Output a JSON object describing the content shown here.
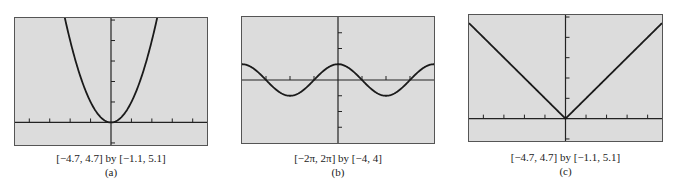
{
  "figure": {
    "panels": [
      {
        "id": "a",
        "range_label": "[−4.7, 4.7] by [−1.1, 5.1]",
        "sub_label": "(a)"
      },
      {
        "id": "b",
        "range_label": "[−2π, 2π] by [−4, 4]",
        "sub_label": "(b)"
      },
      {
        "id": "c",
        "range_label": "[−4.7, 4.7] by [−1.1, 5.1]",
        "sub_label": "(c)"
      }
    ]
  },
  "colors": {
    "plot_background": "#dcdcdc",
    "frame": "#555555",
    "axis": "#222222",
    "curve": "#1a1a1a"
  },
  "chart_data": [
    {
      "type": "line",
      "title": "(a)",
      "function": "y = x^2",
      "xlim": [
        -4.7,
        4.7
      ],
      "ylim": [
        -1.1,
        5.1
      ],
      "xticks": [
        -4,
        -3,
        -2,
        -1,
        1,
        2,
        3,
        4
      ],
      "yticks": [
        -1,
        1,
        2,
        3,
        4,
        5
      ],
      "grid": false,
      "x": [
        -2.26,
        -2,
        -1.5,
        -1,
        -0.5,
        0,
        0.5,
        1,
        1.5,
        2,
        2.26
      ],
      "y": [
        5.1,
        4,
        2.25,
        1,
        0.25,
        0,
        0.25,
        1,
        2.25,
        4,
        5.1
      ],
      "caption": "[−4.7, 4.7] by [−1.1, 5.1]"
    },
    {
      "type": "line",
      "title": "(b)",
      "function": "y = cos x",
      "xlim": [
        -6.2832,
        6.2832
      ],
      "ylim": [
        -4,
        4
      ],
      "xticks": [
        -4.712,
        -3.1416,
        -1.5708,
        1.5708,
        3.1416,
        4.712
      ],
      "yticks": [
        -3,
        -2,
        -1,
        1,
        2,
        3
      ],
      "grid": false,
      "x": [
        -6.2832,
        -4.712,
        -3.1416,
        -1.5708,
        0,
        1.5708,
        3.1416,
        4.712,
        6.2832
      ],
      "y": [
        1,
        0,
        -1,
        0,
        1,
        0,
        -1,
        0,
        1
      ],
      "caption": "[−2π, 2π] by [−4, 4]"
    },
    {
      "type": "line",
      "title": "(c)",
      "function": "y = |x|",
      "xlim": [
        -4.7,
        4.7
      ],
      "ylim": [
        -1.1,
        5.1
      ],
      "xticks": [
        -4,
        -3,
        -2,
        -1,
        1,
        2,
        3,
        4
      ],
      "yticks": [
        -1,
        1,
        2,
        3,
        4,
        5
      ],
      "grid": false,
      "x": [
        -4.7,
        0,
        4.7
      ],
      "y": [
        4.7,
        0,
        4.7
      ],
      "caption": "[−4.7, 4.7] by [−1.1, 5.1]"
    }
  ]
}
